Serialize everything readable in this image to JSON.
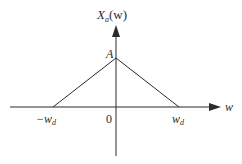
{
  "figure": {
    "type": "triangular-spectrum",
    "y_axis_label": {
      "main": "X",
      "subscript": "a",
      "arg": "(w)"
    },
    "x_axis_label": "w",
    "peak_label": "A",
    "origin_label": "0",
    "left_tick": {
      "prefix": "−w",
      "subscript": "d"
    },
    "right_tick": {
      "prefix": "w",
      "subscript": "d"
    },
    "shape_points": [
      {
        "x": "-w_d",
        "y": 0
      },
      {
        "x": 0,
        "y": "A"
      },
      {
        "x": "w_d",
        "y": 0
      }
    ],
    "colors": {
      "stroke": "#2b2b2b",
      "background": "#ffffff"
    }
  }
}
